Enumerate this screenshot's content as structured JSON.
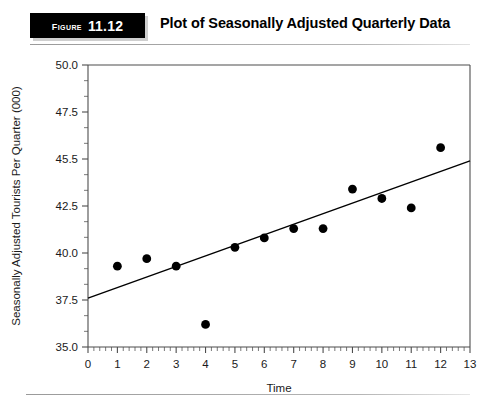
{
  "header": {
    "badge_word": "Figure",
    "badge_number": "11.12",
    "title": "Plot of Seasonally Adjusted Quarterly Data"
  },
  "chart_data": {
    "type": "scatter",
    "title": "Plot of Seasonally Adjusted Quarterly Data",
    "xlabel": "Time",
    "ylabel": "Seasonally Adjusted Tourists Per Quarter (000)",
    "xlim": [
      0,
      13
    ],
    "ylim": [
      35.0,
      50.0
    ],
    "grid": false,
    "legend": null,
    "x_ticks": [
      0,
      1,
      2,
      3,
      4,
      5,
      6,
      7,
      8,
      9,
      10,
      11,
      12,
      13
    ],
    "x_tick_labels": [
      "0",
      "1",
      "2",
      "3",
      "4",
      "5",
      "6",
      "7",
      "8",
      "9",
      "10",
      "11",
      "12",
      "13"
    ],
    "x_minor_per_major": 4,
    "y_ticks": [
      35.0,
      37.5,
      40.0,
      42.5,
      45.0,
      47.5,
      50.0
    ],
    "y_tick_labels": [
      "35.0",
      "37.5",
      "40.0",
      "42.5",
      "45.5",
      "47.5",
      "50.0"
    ],
    "y_minor_per_major": 2,
    "x": [
      1,
      2,
      3,
      4,
      5,
      6,
      7,
      8,
      9,
      10,
      11,
      12
    ],
    "values": [
      39.3,
      39.7,
      39.3,
      36.2,
      40.3,
      40.8,
      41.3,
      41.3,
      43.4,
      42.9,
      42.4,
      45.6
    ],
    "point_color": "#000000",
    "point_size": 6.4,
    "trend_line": {
      "x": [
        0,
        13
      ],
      "y": [
        37.6,
        44.9
      ],
      "color": "#000000"
    }
  }
}
